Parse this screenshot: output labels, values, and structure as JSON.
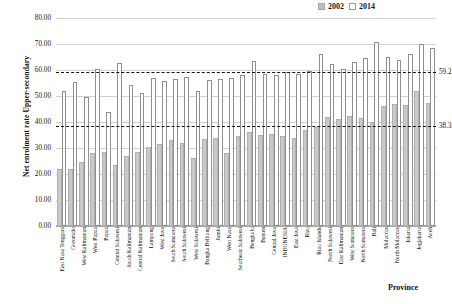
{
  "chart_data": {
    "type": "bar",
    "title": "",
    "xlabel": "Province",
    "ylabel": "Net enrolment rate Upper-secondary",
    "ylim": [
      0,
      80
    ],
    "ytick_labels": [
      "0.00",
      "10.00",
      "20.00",
      "30.00",
      "40.00",
      "50.00",
      "60.00",
      "70.00",
      "80.00"
    ],
    "ytick_values": [
      0,
      10,
      20,
      30,
      40,
      50,
      60,
      70,
      80
    ],
    "grid": true,
    "legend_position": "top-right",
    "categories": [
      "East Nusa Tenggara",
      "Gorontalo",
      "West Kalimantan",
      "West Papua",
      "Papua",
      "Central Sulawesi",
      "South Kalimantan",
      "Central Kalimantan",
      "Lampung",
      "West Java",
      "South Sumatera",
      "South Sulawesi",
      "West Sulawesi",
      "Bangka Belitung",
      "Jambi",
      "West Nusa",
      "Southeast Sulawesi",
      "Bengkulu",
      "Banten",
      "Central Java",
      "INDONESIA",
      "East Java",
      "Riau",
      "Riau Islands",
      "North Sulawesi",
      "East Kalimantan",
      "West Sumatera",
      "North Sumatera",
      "Bali",
      "Moluccas",
      "North Moluccas",
      "Jakarta",
      "Jogjakarta",
      "Aceh"
    ],
    "series": [
      {
        "name": "2002",
        "color": "#c9c9c9",
        "values": [
          21.8,
          22.0,
          24.5,
          28.0,
          28.3,
          23.5,
          27.0,
          28.5,
          30.5,
          31.7,
          33.0,
          32.0,
          26.0,
          33.5,
          34.0,
          28.0,
          34.5,
          36.0,
          35.0,
          35.5,
          34.5,
          34.0,
          37.0,
          38.0,
          42.0,
          41.0,
          42.5,
          41.5,
          40.0,
          46.0,
          47.0,
          46.5,
          52.0,
          47.5
        ]
      },
      {
        "name": "2014",
        "color": "#ffffff",
        "values": [
          51.8,
          55.3,
          49.8,
          60.3,
          43.9,
          62.6,
          54.4,
          51.3,
          56.9,
          55.6,
          56.5,
          57.2,
          52.0,
          56.2,
          56.5,
          57.0,
          58.0,
          63.5,
          58.5,
          58.0,
          59.2,
          58.5,
          59.5,
          66.0,
          62.3,
          60.5,
          63.0,
          64.7,
          70.9,
          65.0,
          64.0,
          66.0,
          70.0,
          68.5
        ]
      }
    ],
    "reference_lines": [
      {
        "name": "upper-average-2014",
        "label": "59.2",
        "value": 59.2
      },
      {
        "name": "lower-average-2002",
        "label": "38.3",
        "value": 38.3
      }
    ]
  },
  "legend": {
    "items": [
      {
        "label": "2002"
      },
      {
        "label": "2014"
      }
    ]
  }
}
